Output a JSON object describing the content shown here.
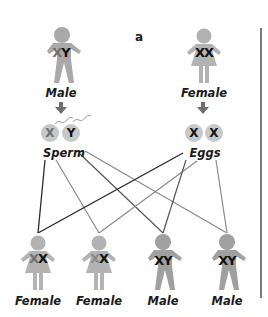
{
  "panel_letter": "a",
  "parents": [
    {
      "label": "Male",
      "chromosomes": [
        "X",
        "Y"
      ],
      "sex": "male"
    },
    {
      "label": "Female",
      "chromosomes": [
        "X",
        "X"
      ],
      "sex": "female"
    }
  ],
  "gametes": [
    {
      "label": "Sperm",
      "items": [
        "X",
        "Y"
      ]
    },
    {
      "label": "Eggs",
      "items": [
        "X",
        "X"
      ]
    }
  ],
  "offspring": [
    {
      "label": "Female",
      "chromosomes": [
        "X",
        "X"
      ],
      "sex": "female"
    },
    {
      "label": "Female",
      "chromosomes": [
        "X",
        "X"
      ],
      "sex": "female"
    },
    {
      "label": "Male",
      "chromosomes": [
        "X",
        "Y"
      ],
      "sex": "male"
    },
    {
      "label": "Male",
      "chromosomes": [
        "X",
        "Y"
      ],
      "sex": "male"
    }
  ],
  "colors": {
    "figure": "#a9a9a9",
    "figure_dark": "#8f8f8f",
    "gamete": "#c8c8c8",
    "line_dark": "#2b2b2b",
    "line_light": "#8a8a8a",
    "x_faded": "#707070",
    "text": "#1a1a1a"
  }
}
